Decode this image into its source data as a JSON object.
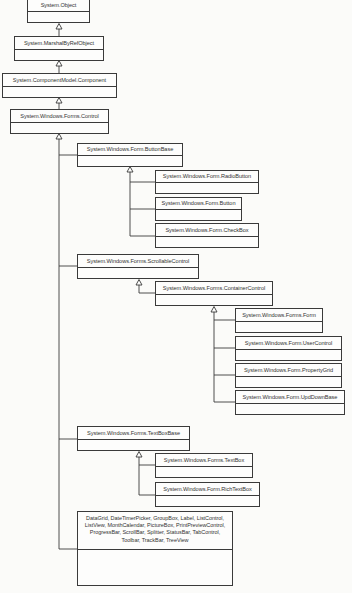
{
  "diagram": {
    "type": "UML class inheritance hierarchy",
    "classes": {
      "object": "System.Object",
      "marshal": "System.MarshalByRefObject",
      "component": "System.ComponentModel.Component",
      "control": "System.Windows.Forms.Control",
      "buttonbase": "System.Windows.Form.ButtonBase",
      "radiobutton": "System.Windows.Form.RadioButton",
      "button": "System.Windows.Form.Button",
      "checkbox": "System.Windows.Form.CheckBox",
      "scrollable": "System.Windows.Forms.ScrollableControl",
      "container": "System.Windows.Forms.ContainerControl",
      "form": "System.Windows.Forms.Form",
      "usercontrol": "System.Windows.Form.UserControl",
      "propertygrid": "System.Windows.Form.PropertyGrid",
      "updownbase": "System.Windows.Form.UpdDownBase",
      "textboxbase": "System.Windows.Forms.TextBoxBase",
      "textbox": "System.Windows.Forms.TextBox",
      "richtextbox": "System.Windows.Form.RichTextBox",
      "others": "DataGrid, DateTimerPicker, GroupBox, Label, ListControl, ListView, MonthCalendar, PictureBox, PrintPreviewControl, ProgressBar, ScrollBar, Splitter, StatusBar, TabControl, Toolbar, TrackBar, TreeView"
    },
    "edges": [
      {
        "child": "System.MarshalByRefObject",
        "parent": "System.Object"
      },
      {
        "child": "System.ComponentModel.Component",
        "parent": "System.MarshalByRefObject"
      },
      {
        "child": "System.Windows.Forms.Control",
        "parent": "System.ComponentModel.Component"
      },
      {
        "child": "System.Windows.Form.ButtonBase",
        "parent": "System.Windows.Forms.Control"
      },
      {
        "child": "System.Windows.Forms.ScrollableControl",
        "parent": "System.Windows.Forms.Control"
      },
      {
        "child": "System.Windows.Forms.TextBoxBase",
        "parent": "System.Windows.Forms.Control"
      },
      {
        "child": "Other controls group",
        "parent": "System.Windows.Forms.Control"
      },
      {
        "child": "System.Windows.Form.RadioButton",
        "parent": "System.Windows.Form.ButtonBase"
      },
      {
        "child": "System.Windows.Form.Button",
        "parent": "System.Windows.Form.ButtonBase"
      },
      {
        "child": "System.Windows.Form.CheckBox",
        "parent": "System.Windows.Form.ButtonBase"
      },
      {
        "child": "System.Windows.Forms.ContainerControl",
        "parent": "System.Windows.Forms.ScrollableControl"
      },
      {
        "child": "System.Windows.Forms.Form",
        "parent": "System.Windows.Forms.ContainerControl"
      },
      {
        "child": "System.Windows.Form.UserControl",
        "parent": "System.Windows.Forms.ContainerControl"
      },
      {
        "child": "System.Windows.Form.PropertyGrid",
        "parent": "System.Windows.Forms.ContainerControl"
      },
      {
        "child": "System.Windows.Form.UpdDownBase",
        "parent": "System.Windows.Forms.ContainerControl"
      },
      {
        "child": "System.Windows.Forms.TextBox",
        "parent": "System.Windows.Forms.TextBoxBase"
      },
      {
        "child": "System.Windows.Form.RichTextBox",
        "parent": "System.Windows.Forms.TextBoxBase"
      }
    ]
  },
  "colors": {
    "line": "#3a3a3a",
    "text": "#333333",
    "background": "#fbfbf9"
  }
}
